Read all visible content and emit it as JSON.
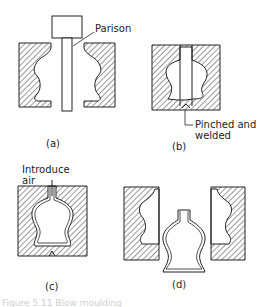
{
  "figure": {
    "panels": [
      {
        "id": "a",
        "label": "(a)",
        "annotation": "Parison"
      },
      {
        "id": "b",
        "label": "(b)",
        "annotation_line1": "Pinched and",
        "annotation_line2": "welded"
      },
      {
        "id": "c",
        "label": "(c)",
        "annotation_line1": "Introduce",
        "annotation_line2": "air"
      },
      {
        "id": "d",
        "label": "(d)"
      }
    ],
    "caption_fragment": "Figure 5.11  Blow moulding"
  },
  "colors": {
    "line": "#222222",
    "hatch": "#333333",
    "background": "#ffffff"
  }
}
